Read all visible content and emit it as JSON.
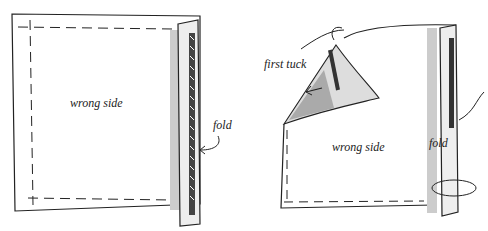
{
  "diagrams": [
    {
      "id": "left",
      "labels": {
        "center": "wrong side",
        "edge": "fold"
      }
    },
    {
      "id": "right",
      "labels": {
        "tuck": "first tuck",
        "center": "wrong side",
        "edge": "fold"
      }
    }
  ],
  "colors": {
    "ink": "#222222",
    "shade": "#bbbbbb",
    "paper": "#ffffff"
  }
}
